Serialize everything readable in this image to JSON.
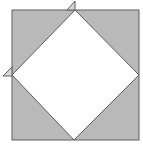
{
  "diagram": {
    "outer_square": {
      "x": 12,
      "y": 10,
      "width": 127,
      "height": 130
    },
    "diamond": {
      "top": [
        75,
        10
      ],
      "right": [
        139,
        75
      ],
      "bottom": [
        74,
        140
      ],
      "left": [
        12,
        75
      ]
    },
    "flaps": [
      {
        "name": "top-flap",
        "points": [
          [
            67,
            10
          ],
          [
            75,
            1
          ],
          [
            75,
            10
          ]
        ]
      },
      {
        "name": "left-flap",
        "points": [
          [
            3,
            76
          ],
          [
            12,
            67
          ],
          [
            12,
            76
          ]
        ]
      }
    ],
    "colors": {
      "shaded": "#b9b9b9",
      "inner": "#ffffff",
      "stroke": "#5e5e5e",
      "flap": "#d6d6d6"
    }
  }
}
